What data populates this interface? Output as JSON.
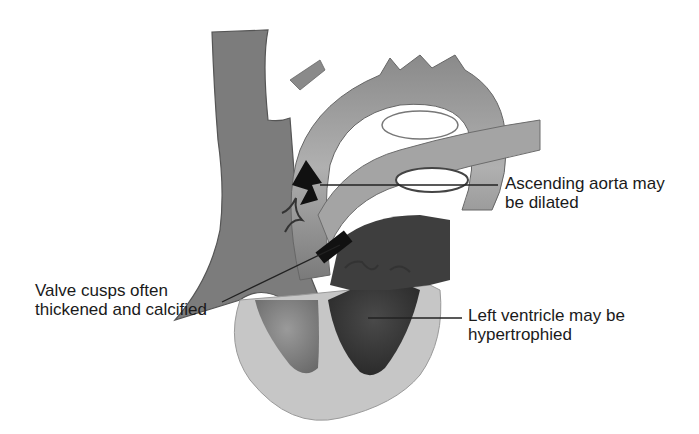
{
  "figure": {
    "colors": {
      "background": "#ffffff",
      "wall_light": "#c4c4c4",
      "vessel_mid": "#8c8c8c",
      "vessel_dark": "#6a6a6a",
      "chamber_dark": "#3a3a3a",
      "arrow": "#111111",
      "leader_line": "#222222",
      "text": "#1a1a1a"
    }
  },
  "annotations": [
    {
      "id": "aorta",
      "lines": [
        "Ascending aorta may",
        "be dilated"
      ]
    },
    {
      "id": "valve",
      "lines": [
        "Valve cusps often",
        "thickened and calcified"
      ]
    },
    {
      "id": "ventricle",
      "lines": [
        "Left ventricle may be",
        "hypertrophied"
      ]
    }
  ]
}
